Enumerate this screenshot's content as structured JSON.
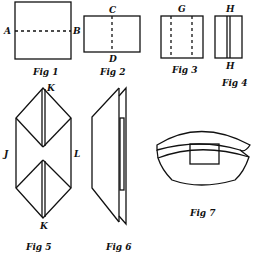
{
  "figures": [
    {
      "id": "fig1",
      "caption": "Fig 1",
      "labels": {
        "left": "A",
        "right": "B"
      }
    },
    {
      "id": "fig2",
      "caption": "Fig 2",
      "labels": {
        "top": "C",
        "bottom": "D"
      }
    },
    {
      "id": "fig3",
      "caption": "Fig 3",
      "labels": {
        "top": "G"
      }
    },
    {
      "id": "fig4",
      "caption": "Fig 4",
      "labels": {
        "top": "H",
        "bottom": "H"
      }
    },
    {
      "id": "fig5",
      "caption": "Fig 5",
      "labels": {
        "top": "K",
        "bottom": "K",
        "left": "J",
        "right": "L"
      }
    },
    {
      "id": "fig6",
      "caption": "Fig 6"
    },
    {
      "id": "fig7",
      "caption": "Fig 7"
    }
  ],
  "colors": {
    "line": "#111111",
    "background": "#ffffff"
  }
}
